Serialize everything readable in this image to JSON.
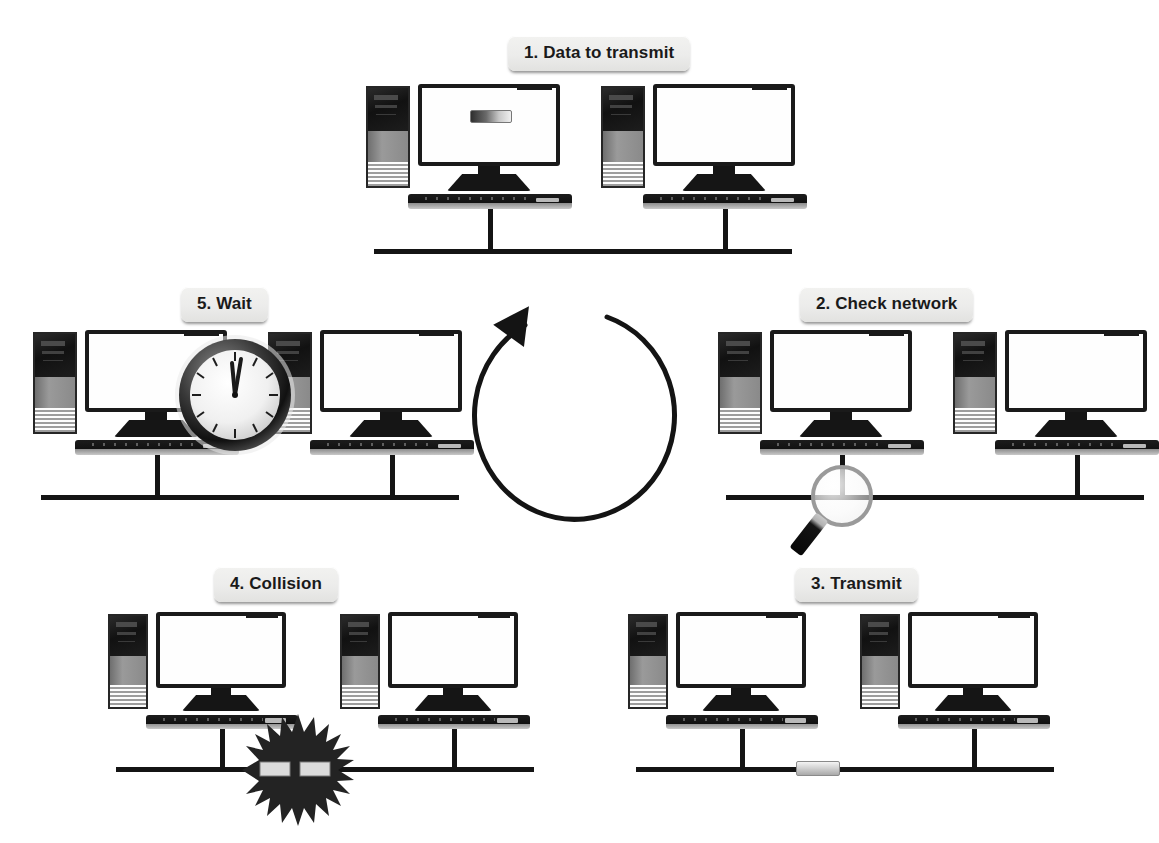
{
  "diagram": {
    "background_color": "#ffffff",
    "line_color": "#141414",
    "badge_background": "#ececeb",
    "badge_text_color": "#1a1a1a"
  },
  "steps": [
    {
      "id": "step-1",
      "number": "1",
      "label": "1. Data to transmit",
      "position": "top-center",
      "computers": 2,
      "annotation": "data-packet-on-screen"
    },
    {
      "id": "step-2",
      "number": "2",
      "label": "2. Check network",
      "position": "middle-right",
      "computers": 2,
      "annotation": "magnifying-glass"
    },
    {
      "id": "step-3",
      "number": "3",
      "label": "3. Transmit",
      "position": "bottom-right",
      "computers": 2,
      "annotation": "packet-on-bus"
    },
    {
      "id": "step-4",
      "number": "4",
      "label": "4. Collision",
      "position": "bottom-left",
      "computers": 2,
      "annotation": "collision-starburst"
    },
    {
      "id": "step-5",
      "number": "5",
      "label": "5. Wait",
      "position": "middle-left",
      "computers": 2,
      "annotation": "analog-clock"
    }
  ],
  "cycle": {
    "icon": "circular-clockwise-arrow",
    "direction": "clockwise",
    "stroke_color": "#141414"
  },
  "icons": {
    "magnifier": "magnifying-glass-icon",
    "clock": "analog-clock-icon",
    "collision": "collision-starburst-icon",
    "packet": "data-packet-icon"
  }
}
